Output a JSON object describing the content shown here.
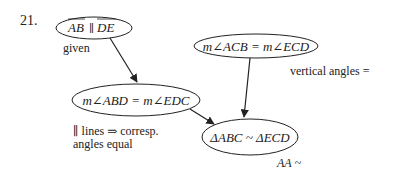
{
  "problem": {
    "number": "21."
  },
  "nodes": {
    "given_node": {
      "statement": "AB ∥ DE",
      "overline_left": "AB",
      "parallel": "∥",
      "overline_right": "DE",
      "reason": "given"
    },
    "vertical_node": {
      "statement": "m∠ACB = m∠ECD",
      "reason": "vertical angles ="
    },
    "corresp_node": {
      "statement": "m∠ABD = m∠EDC",
      "reason_line1": "∥ lines ⇒ corresp.",
      "reason_line2": "angles equal"
    },
    "conclusion_node": {
      "statement": "ΔABC ~ ΔECD",
      "reason": "AA ~"
    }
  },
  "edges": [
    {
      "from": "given_node",
      "to": "corresp_node"
    },
    {
      "from": "corresp_node",
      "to": "conclusion_node"
    },
    {
      "from": "vertical_node",
      "to": "conclusion_node"
    }
  ],
  "colors": {
    "stroke": "#222222",
    "text": "#222222",
    "background": "#ffffff"
  }
}
